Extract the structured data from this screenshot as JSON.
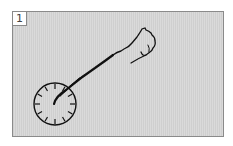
{
  "panel": {
    "number": "1",
    "background": "#d2d2d2",
    "border": "#8a8a8a"
  },
  "illustration": {
    "elements": [
      "clock-face-with-tick-marks",
      "arm-line",
      "fist-hand-icon"
    ],
    "clock": {
      "cx": 55,
      "cy": 104,
      "r": 21,
      "ticks": 12
    },
    "ink_color": "#111111"
  }
}
